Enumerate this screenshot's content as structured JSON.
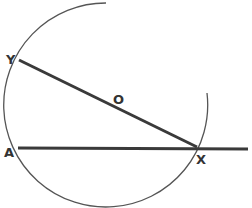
{
  "diagram": {
    "title": "",
    "labels": {
      "Y": "Y",
      "O": "O",
      "A": "A",
      "X": "X"
    },
    "colors": {
      "stroke": "#3a3a3a",
      "arc": "#555555",
      "background": "#ffffff"
    },
    "elements": {
      "circle_arc": {
        "center": [
          113,
          103
        ],
        "radius": 102
      },
      "diameter_YX": {
        "from": "Y",
        "to": "X"
      },
      "line_AX": {
        "from": "A",
        "through": "X",
        "extends_right": true
      }
    }
  }
}
